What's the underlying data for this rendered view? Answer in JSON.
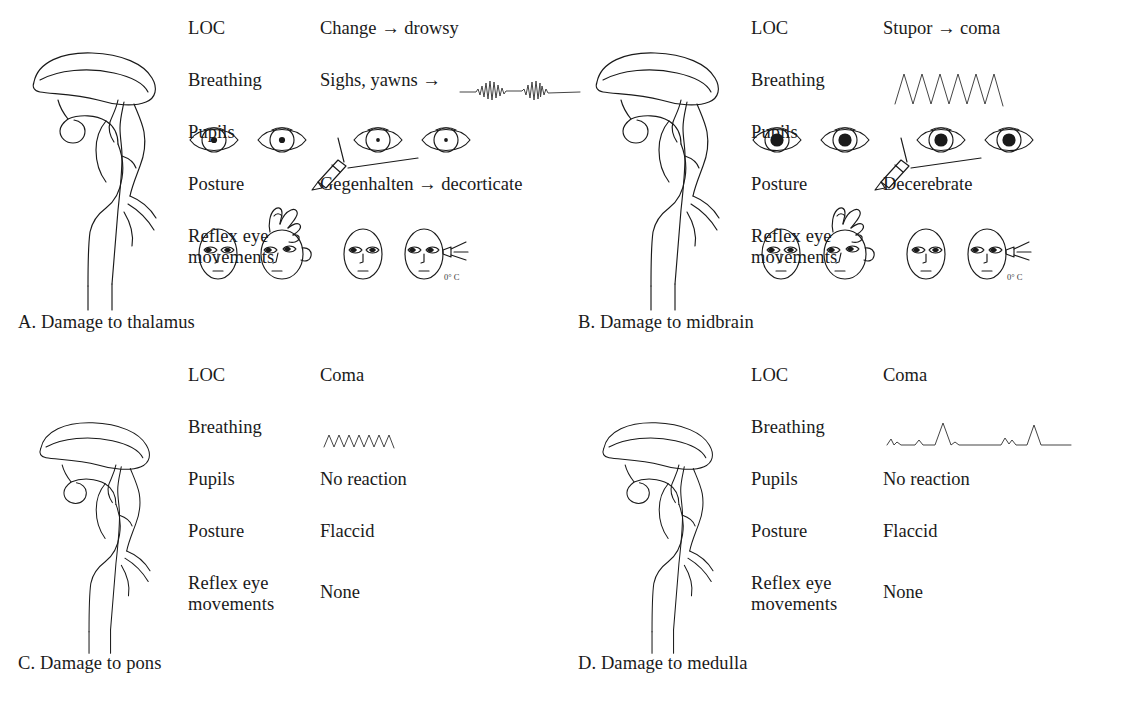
{
  "figure": {
    "type": "clinical-comparison-diagram",
    "row_labels": [
      "LOC",
      "Breathing",
      "Pupils",
      "Posture",
      "Reflex eye\nmovements"
    ]
  },
  "panels": [
    {
      "id": "A",
      "caption": "A. Damage to thalamus",
      "brain_icon": "sagittal-brainstem-icon",
      "rows": [
        {
          "label": "LOC",
          "value": "Change → drowsy",
          "graphic": null
        },
        {
          "label": "Breathing",
          "value": "Sighs, yawns →",
          "graphic": "cheyne-stokes-waveform"
        },
        {
          "label": "Pupils",
          "value": "",
          "graphic": "small-reactive-pupils-penlight"
        },
        {
          "label": "Posture",
          "value": "Gegenhalten → decorticate",
          "graphic": null
        },
        {
          "label": "Reflex eye\nmovements",
          "value": "",
          "graphic": "dolls-eye-and-caloric-faces"
        }
      ]
    },
    {
      "id": "B",
      "caption": "B. Damage to midbrain",
      "brain_icon": "sagittal-brainstem-icon",
      "rows": [
        {
          "label": "LOC",
          "value": "Stupor → coma",
          "graphic": null
        },
        {
          "label": "Breathing",
          "value": "",
          "graphic": "central-neurogenic-hyperventilation-waveform"
        },
        {
          "label": "Pupils",
          "value": "",
          "graphic": "midposition-fixed-pupils-penlight"
        },
        {
          "label": "Posture",
          "value": "Decerebrate",
          "graphic": null
        },
        {
          "label": "Reflex eye\nmovements",
          "value": "",
          "graphic": "dolls-eye-and-caloric-faces"
        }
      ]
    },
    {
      "id": "C",
      "caption": "C. Damage to pons",
      "brain_icon": "sagittal-brainstem-icon",
      "rows": [
        {
          "label": "LOC",
          "value": "Coma",
          "graphic": null
        },
        {
          "label": "Breathing",
          "value": "",
          "graphic": "apneustic-cluster-waveform"
        },
        {
          "label": "Pupils",
          "value": "No reaction",
          "graphic": null
        },
        {
          "label": "Posture",
          "value": "Flaccid",
          "graphic": null
        },
        {
          "label": "Reflex eye\nmovements",
          "value": "None",
          "graphic": null
        }
      ]
    },
    {
      "id": "D",
      "caption": "D. Damage to medulla",
      "brain_icon": "sagittal-brainstem-icon",
      "rows": [
        {
          "label": "LOC",
          "value": "Coma",
          "graphic": null
        },
        {
          "label": "Breathing",
          "value": "",
          "graphic": "ataxic-waveform"
        },
        {
          "label": "Pupils",
          "value": "No reaction",
          "graphic": null
        },
        {
          "label": "Posture",
          "value": "Flaccid",
          "graphic": null
        },
        {
          "label": "Reflex eye\nmovements",
          "value": "None",
          "graphic": null
        }
      ]
    }
  ],
  "annotations": {
    "caloric_temperature": "0° C"
  },
  "colors": {
    "background": "#ffffff",
    "ink": "#1a1a1a",
    "light_ink": "#3a3a3a"
  }
}
